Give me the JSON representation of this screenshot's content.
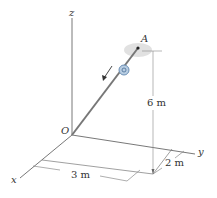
{
  "diagram": {
    "axes": {
      "x_label": "x",
      "y_label": "y",
      "z_label": "z",
      "origin_label": "O"
    },
    "point_label": "A",
    "dimensions": {
      "height": "6 m",
      "x_distance": "3 m",
      "y_distance": "2 m"
    },
    "colors": {
      "line": "#555555",
      "rod": "#777777",
      "collar": "#6b8fb5",
      "shadow": "#cccccc"
    }
  }
}
